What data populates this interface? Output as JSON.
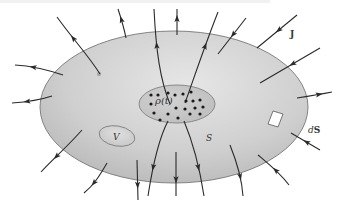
{
  "figure": {
    "labels": {
      "current_density": "J",
      "charge_density": "ρ(t)",
      "volume": "V",
      "surface": "S",
      "surface_element": "dS",
      "surface_element_prefix": "d",
      "surface_element_vector": "S"
    },
    "colors": {
      "surface_fill_light": "#e4e4e4",
      "surface_fill_dark": "#b8b8b8",
      "surface_stroke": "#666666",
      "inner_fill": "#c6c6c6",
      "line": "#2a2a2a",
      "dot": "#1a1a1a",
      "patch_fill": "#ffffff"
    },
    "flux_lines": [
      {
        "id": "top-left-1",
        "direction": "out"
      },
      {
        "id": "top-left-2",
        "direction": "out"
      },
      {
        "id": "top-center-1",
        "direction": "out"
      },
      {
        "id": "top-center-2",
        "direction": "out"
      },
      {
        "id": "top-right-1",
        "direction": "out"
      },
      {
        "id": "top-right-2",
        "direction": "in"
      },
      {
        "id": "top-right-3",
        "direction": "in"
      },
      {
        "id": "right-1",
        "direction": "in"
      },
      {
        "id": "right-2",
        "direction": "out"
      },
      {
        "id": "right-3",
        "direction": "in"
      },
      {
        "id": "bottom-right-1",
        "direction": "in"
      },
      {
        "id": "bottom-right-2",
        "direction": "out"
      },
      {
        "id": "bottom-center-1",
        "direction": "out"
      },
      {
        "id": "bottom-center-2",
        "direction": "out"
      },
      {
        "id": "bottom-center-3",
        "direction": "out"
      },
      {
        "id": "bottom-left-1",
        "direction": "out"
      },
      {
        "id": "bottom-left-2",
        "direction": "out"
      },
      {
        "id": "bottom-left-3",
        "direction": "out"
      },
      {
        "id": "left-1",
        "direction": "out"
      },
      {
        "id": "left-2",
        "direction": "out"
      }
    ],
    "charge_dot_count": 20
  }
}
